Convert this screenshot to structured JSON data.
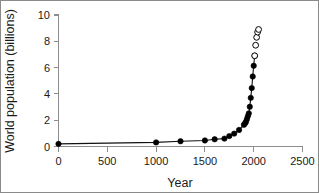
{
  "figure": {
    "width": 319,
    "height": 193,
    "background": "#ffffff",
    "border_color": "#8a8a8a"
  },
  "chart_data": {
    "type": "scatter",
    "title": "",
    "xlabel": "Year",
    "ylabel": "World population (billions)",
    "xlim": [
      0,
      2500
    ],
    "ylim": [
      0,
      10
    ],
    "xticks": [
      0,
      500,
      1000,
      1500,
      2000,
      2500
    ],
    "yticks": [
      0,
      2,
      4,
      6,
      8,
      10
    ],
    "xtick_labels": [
      "0",
      "500",
      "1000",
      "1500",
      "2000",
      "2500"
    ],
    "ytick_labels": [
      "0",
      "2",
      "4",
      "6",
      "8",
      "10"
    ],
    "grid": false,
    "legend": false,
    "legend_position": "none",
    "series": [
      {
        "name": "Historical estimates",
        "marker": "filled-circle",
        "marker_color": "#000000",
        "line": true,
        "line_color": "#111111",
        "x": [
          0,
          1000,
          1250,
          1500,
          1600,
          1700,
          1750,
          1800,
          1850,
          1900,
          1910,
          1920,
          1930,
          1940,
          1950,
          1960,
          1970,
          1980,
          1990,
          2000,
          2010
        ],
        "y": [
          0.2,
          0.31,
          0.4,
          0.46,
          0.55,
          0.6,
          0.79,
          0.98,
          1.26,
          1.65,
          1.75,
          1.86,
          2.07,
          2.3,
          2.52,
          3.02,
          3.7,
          4.44,
          5.32,
          6.14,
          6.9
        ]
      },
      {
        "name": "Projections",
        "marker": "open-circle",
        "marker_color": "#ffffff",
        "marker_edge_color": "#000000",
        "line": false,
        "x": [
          2010,
          2020,
          2030,
          2040,
          2050
        ],
        "y": [
          6.9,
          7.7,
          8.3,
          8.7,
          8.9
        ]
      }
    ],
    "annotations": []
  },
  "axes": {
    "x_axis_name": "year-axis",
    "y_axis_name": "population-axis"
  }
}
